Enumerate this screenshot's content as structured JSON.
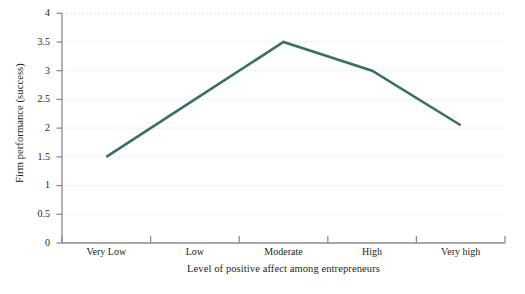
{
  "chart_data": {
    "type": "line",
    "title": "",
    "subtitle": "",
    "xlabel": "Level of positive affect among entrepreneurs",
    "ylabel": "Firm performance (success)",
    "categories": [
      "Very Low",
      "Low",
      "Moderate",
      "High",
      "Very high"
    ],
    "values": [
      1.5,
      2.5,
      3.5,
      3.0,
      2.05
    ],
    "series": [
      {
        "name": "Firm performance",
        "values": [
          1.5,
          2.5,
          3.5,
          3.0,
          2.05
        ],
        "color": "#3a6f63"
      }
    ],
    "ylim": [
      0,
      4
    ],
    "xlim_categorical": true,
    "ytick_labels": [
      "0",
      "0.5",
      "1",
      "1.5",
      "2",
      "2.5",
      "3",
      "3.5",
      "4"
    ],
    "ytick_values": [
      0,
      0.5,
      1,
      1.5,
      2,
      2.5,
      3,
      3.5,
      4
    ],
    "xtick_labels": [
      "Very Low",
      "Low",
      "Moderate",
      "High",
      "Very high"
    ],
    "grid": "horizontal-dotted",
    "grid_color": "#e8e2e4",
    "legend": "none",
    "legend_position": "none",
    "axis_color": "#8d8b8c",
    "line_width": 2.6,
    "markers": "none",
    "annotations": []
  },
  "axes": {
    "y_title": "Firm performance (success)",
    "x_title": "Level of positive affect among entrepreneurs"
  }
}
